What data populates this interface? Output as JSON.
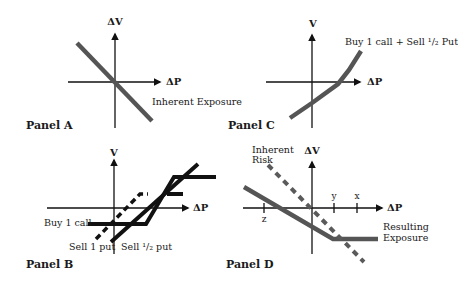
{
  "figure": {
    "panels": [
      {
        "id": "A",
        "title": "Panel A",
        "title_pos": [
          26,
          129
        ],
        "y_axis_label": "ΔV",
        "x_axis_label": "ΔP",
        "axes": {
          "x_axis": [
            68,
            82,
            160,
            82
          ],
          "y_axis": [
            115,
            128,
            115,
            34
          ],
          "y_label_pos": [
            115,
            25
          ],
          "x_label_pos": [
            166,
            85
          ]
        },
        "annotations": [
          {
            "text": "Inherent Exposure",
            "pos": [
              152,
              105
            ]
          }
        ],
        "series": [
          {
            "name": "Inherent Exposure",
            "style": "thick-gray",
            "points": [
              [
                77,
                43
              ],
              [
                152,
                121
              ]
            ]
          }
        ]
      },
      {
        "id": "C",
        "title": "Panel C",
        "title_pos": [
          228,
          129
        ],
        "y_axis_label": "V",
        "x_axis_label": "ΔP",
        "axes": {
          "x_axis": [
            266,
            82,
            360,
            82
          ],
          "y_axis": [
            312,
            128,
            312,
            35
          ],
          "y_label_pos": [
            313,
            27
          ],
          "x_label_pos": [
            367,
            85
          ]
        },
        "annotations": [
          {
            "text": "Buy 1 call + Sell ¹/₂ Put",
            "pos": [
              345,
              45
            ]
          }
        ],
        "series": [
          {
            "name": "Buy 1 call + Sell 1/2 Put",
            "style": "thick-gray",
            "points": [
              [
                290,
                118
              ],
              [
                312,
                103
              ],
              [
                338,
                84
              ],
              [
                349,
                70
              ],
              [
                361,
                51
              ]
            ]
          }
        ]
      },
      {
        "id": "B",
        "title": "Panel B",
        "title_pos": [
          26,
          268
        ],
        "y_axis_label": "V",
        "x_axis_label": "ΔP",
        "axes": {
          "x_axis": [
            47,
            208,
            188,
            208
          ],
          "y_axis": [
            114,
            254,
            114,
            160
          ],
          "y_label_pos": [
            114,
            156
          ],
          "x_label_pos": [
            193,
            211
          ]
        },
        "annotations": [
          {
            "text": "Buy 1 call",
            "pos": [
              44,
              226
            ]
          },
          {
            "text": "Sell 1 put",
            "pos": [
              69,
              250
            ]
          },
          {
            "text": "Sell ¹/₂ put",
            "pos": [
              121,
              250
            ]
          }
        ],
        "series": [
          {
            "name": "Buy 1 call",
            "style": "thick-black",
            "points": [
              [
                88,
                224
              ],
              [
                146,
                224
              ],
              [
                174,
                177
              ],
              [
                216,
                177
              ]
            ]
          },
          {
            "name": "Sell 1 put",
            "style": "thick-black",
            "points": [
              [
                111,
                242
              ],
              [
                198,
                164
              ]
            ]
          },
          {
            "name": "Sell 1/2 put",
            "style": "dashed-black",
            "points": [
              [
                96,
                239
              ],
              [
                140,
                194
              ],
              [
                148,
                194
              ]
            ]
          },
          {
            "name": "Sell 1/2 put cap",
            "style": "thick-black",
            "points": [
              [
                167,
                194
              ],
              [
                183,
                194
              ]
            ]
          }
        ]
      },
      {
        "id": "D",
        "title": "Panel D",
        "title_pos": [
          226,
          268
        ],
        "y_axis_label": "ΔV",
        "x_axis_label": "ΔP",
        "axes": {
          "x_axis": [
            243,
            208,
            382,
            208
          ],
          "y_axis": [
            312,
            254,
            312,
            162
          ],
          "y_label_pos": [
            312,
            154
          ],
          "x_label_pos": [
            387,
            211
          ]
        },
        "ticks": [
          {
            "label": "z",
            "x": 264,
            "label_y": 222
          },
          {
            "label": "y",
            "x": 334,
            "label_y": 199
          },
          {
            "label": "x",
            "x": 357,
            "label_y": 199
          }
        ],
        "annotations": [
          {
            "text": "Inherent",
            "pos": [
              252,
              153
            ]
          },
          {
            "text": "Risk",
            "pos": [
              252,
              163
            ]
          },
          {
            "text": "Resulting",
            "pos": [
              383,
              230
            ]
          },
          {
            "text": "Exposure",
            "pos": [
              383,
              241
            ]
          }
        ],
        "series": [
          {
            "name": "Resulting Exposure",
            "style": "thick-gray",
            "points": [
              [
                244,
                187
              ],
              [
                333,
                239
              ],
              [
                378,
                239
              ]
            ]
          },
          {
            "name": "Inherent Risk",
            "style": "dashed-gray",
            "points": [
              [
                268,
                165
              ],
              [
                364,
                262
              ]
            ]
          }
        ]
      }
    ],
    "colors": {
      "thick_gray": "#555555",
      "thick_black": "#111111",
      "dashed_gray": "#5a5a5a",
      "axis": "#111111"
    }
  }
}
